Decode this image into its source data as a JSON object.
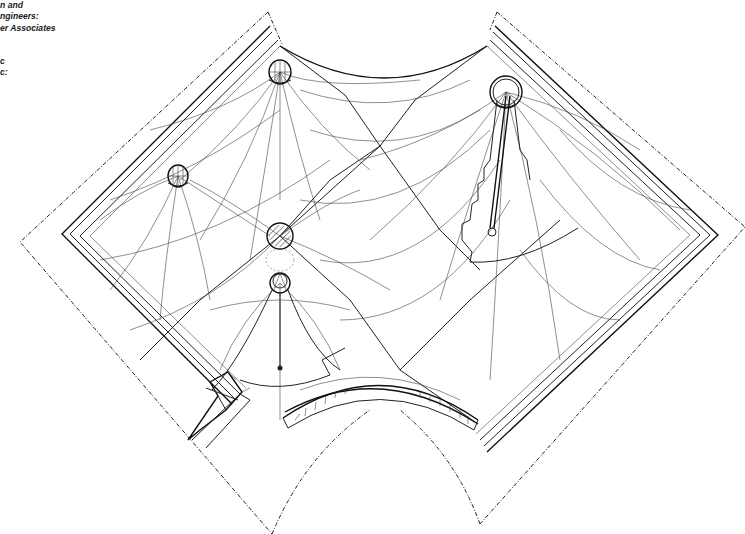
{
  "drawing": {
    "type": "architectural axonometric drawing",
    "subject": "tensile fabric tent roof with masts, square plan rotated 45 degrees",
    "caption_lines": [
      "n and",
      "ngineers:",
      "er Associates",
      "",
      "c",
      "c:"
    ],
    "elements": {
      "masts": [
        {
          "name": "mast-top-left",
          "cx": 280,
          "cy": 72,
          "r": 12,
          "style": "dome"
        },
        {
          "name": "mast-left",
          "cx": 178,
          "cy": 176,
          "r": 11,
          "style": "dome"
        },
        {
          "name": "mast-center",
          "cx": 280,
          "cy": 236,
          "r": 13,
          "style": "hatched-sphere"
        },
        {
          "name": "mast-lower",
          "cx": 280,
          "cy": 283,
          "r": 10,
          "style": "ring"
        },
        {
          "name": "mast-right",
          "cx": 506,
          "cy": 92,
          "r": 16,
          "style": "ring-with-ladder"
        }
      ],
      "corners": {
        "top": [
          268,
          12
        ],
        "top_right": [
          497,
          12
        ],
        "right": [
          745,
          227
        ],
        "bottom_right": [
          480,
          524
        ],
        "bottom": [
          380,
          390
        ],
        "bottom_left": [
          272,
          534
        ],
        "left": [
          20,
          242
        ]
      }
    }
  }
}
